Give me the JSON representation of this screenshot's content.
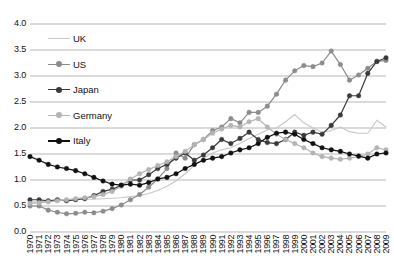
{
  "chart_data": {
    "type": "line",
    "title": "",
    "subtitle": "",
    "xlabel": "",
    "ylabel": "",
    "grid": true,
    "legend_position": "upper-left-inside",
    "ylim": [
      0.0,
      4.0
    ],
    "yticks": [
      "0.0",
      "0.5",
      "1.0",
      "1.5",
      "2.0",
      "2.5",
      "3.0",
      "3.5",
      "4.0"
    ],
    "ytick_values": [
      0.0,
      0.5,
      1.0,
      1.5,
      2.0,
      2.5,
      3.0,
      3.5,
      4.0
    ],
    "x": [
      1970,
      1971,
      1972,
      1973,
      1974,
      1975,
      1976,
      1977,
      1978,
      1979,
      1980,
      1981,
      1982,
      1983,
      1984,
      1985,
      1986,
      1987,
      1988,
      1989,
      1990,
      1991,
      1992,
      1993,
      1994,
      1995,
      1996,
      1997,
      1998,
      1999,
      2000,
      2001,
      2002,
      2003,
      2004,
      2005,
      2006,
      2007,
      2008,
      2009
    ],
    "categories": [
      "1970",
      "1971",
      "1972",
      "1973",
      "1974",
      "1975",
      "1976",
      "1977",
      "1978",
      "1979",
      "1980",
      "1981",
      "1982",
      "1983",
      "1984",
      "1985",
      "1986",
      "1987",
      "1988",
      "1989",
      "1990",
      "1991",
      "1992",
      "1993",
      "1994",
      "1995",
      "1996",
      "1997",
      "1998",
      "1999",
      "2000",
      "2001",
      "2002",
      "2003",
      "2004",
      "2005",
      "2006",
      "2007",
      "2008",
      "2009"
    ],
    "series": [
      {
        "name": "UK",
        "color": "#c8c8c8",
        "marker": "none",
        "values": [
          0.58,
          0.58,
          0.6,
          0.6,
          0.62,
          0.62,
          0.63,
          0.63,
          0.64,
          0.65,
          0.66,
          0.68,
          0.7,
          0.74,
          0.8,
          0.88,
          0.98,
          1.12,
          1.28,
          1.42,
          1.52,
          1.58,
          1.62,
          1.7,
          1.8,
          1.88,
          1.96,
          2.0,
          2.12,
          2.26,
          2.1,
          2.0,
          1.92,
          1.95,
          2.02,
          1.93,
          1.9,
          1.9,
          2.15,
          2.02
        ]
      },
      {
        "name": "US",
        "color": "#8c8c8c",
        "marker": "circle",
        "values": [
          0.5,
          0.5,
          0.42,
          0.38,
          0.35,
          0.36,
          0.38,
          0.37,
          0.4,
          0.45,
          0.52,
          0.62,
          0.72,
          0.86,
          1.02,
          1.22,
          1.52,
          1.42,
          1.68,
          1.78,
          1.95,
          2.02,
          2.18,
          2.1,
          2.3,
          2.3,
          2.42,
          2.65,
          2.92,
          3.1,
          3.2,
          3.18,
          3.25,
          3.48,
          3.22,
          2.92,
          3.02,
          3.15,
          3.28,
          3.3
        ]
      },
      {
        "name": "Japan",
        "color": "#3a3a3a",
        "marker": "circle",
        "values": [
          0.62,
          0.62,
          0.6,
          0.62,
          0.6,
          0.62,
          0.64,
          0.7,
          0.78,
          0.82,
          0.9,
          1.0,
          1.0,
          1.1,
          1.22,
          1.3,
          1.42,
          1.52,
          1.38,
          1.48,
          1.62,
          1.78,
          1.7,
          1.8,
          1.92,
          1.78,
          1.72,
          1.7,
          1.78,
          1.92,
          1.86,
          1.92,
          1.88,
          2.05,
          2.25,
          2.62,
          2.62,
          3.05,
          3.28,
          3.35
        ]
      },
      {
        "name": "Germany",
        "color": "#b4b4b4",
        "marker": "circle",
        "values": [
          0.55,
          0.56,
          0.58,
          0.6,
          0.62,
          0.64,
          0.66,
          0.68,
          0.72,
          0.78,
          0.88,
          1.02,
          1.12,
          1.2,
          1.28,
          1.35,
          1.45,
          1.55,
          1.68,
          1.78,
          1.9,
          1.98,
          2.05,
          2.02,
          2.12,
          2.18,
          2.02,
          1.88,
          1.78,
          1.7,
          1.62,
          1.52,
          1.45,
          1.42,
          1.4,
          1.42,
          1.45,
          1.5,
          1.62,
          1.58
        ]
      },
      {
        "name": "Italy",
        "color": "#111111",
        "marker": "circle",
        "values": [
          1.45,
          1.38,
          1.3,
          1.25,
          1.22,
          1.18,
          1.12,
          1.05,
          0.98,
          0.92,
          0.9,
          0.92,
          0.9,
          0.95,
          1.02,
          1.05,
          1.12,
          1.22,
          1.3,
          1.38,
          1.42,
          1.45,
          1.52,
          1.58,
          1.62,
          1.7,
          1.82,
          1.9,
          1.92,
          1.88,
          1.78,
          1.7,
          1.62,
          1.58,
          1.55,
          1.5,
          1.46,
          1.42,
          1.5,
          1.52
        ]
      }
    ]
  }
}
